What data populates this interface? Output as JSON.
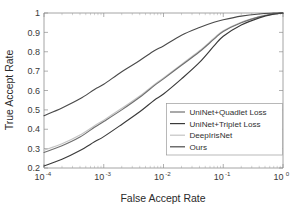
{
  "chart_data": {
    "type": "line",
    "title": "",
    "xlabel": "False Accept Rate",
    "ylabel": "True Accept Rate",
    "xscale": "log",
    "yscale": "linear",
    "xlim": [
      0.0001,
      1
    ],
    "ylim": [
      0.2,
      1
    ],
    "grid": false,
    "legend_position": "lower-right",
    "xticklabels": [
      "10-4",
      "10-3",
      "10-2",
      "10-1",
      "100"
    ],
    "xtick_bases": [
      "10",
      "10",
      "10",
      "10",
      "10"
    ],
    "xtick_exponents": [
      "-4",
      "-3",
      "-2",
      "-1",
      "0"
    ],
    "yticklabels": [
      "0.2",
      "0.3",
      "0.4",
      "0.5",
      "0.6",
      "0.7",
      "0.8",
      "0.9",
      "1"
    ],
    "ytickvalues": [
      0.2,
      0.3,
      0.4,
      0.5,
      0.6,
      0.7,
      0.8,
      0.9,
      1.0
    ],
    "x": [
      0.0001,
      0.0002,
      0.0004,
      0.0007,
      0.001,
      0.002,
      0.004,
      0.007,
      0.01,
      0.02,
      0.04,
      0.07,
      0.1,
      0.2,
      0.4,
      0.7,
      1.0
    ],
    "series": [
      {
        "name": "UniNet+Quadlet Loss",
        "color": "#6f6f6f",
        "values": [
          0.28,
          0.315,
          0.36,
          0.41,
          0.44,
          0.5,
          0.565,
          0.625,
          0.66,
          0.73,
          0.8,
          0.865,
          0.905,
          0.95,
          0.98,
          0.995,
          1.0
        ]
      },
      {
        "name": "UniNet+Triplet Loss",
        "color": "#3a3a3a",
        "values": [
          0.21,
          0.245,
          0.29,
          0.335,
          0.362,
          0.425,
          0.49,
          0.55,
          0.582,
          0.66,
          0.745,
          0.83,
          0.88,
          0.938,
          0.975,
          0.994,
          1.0
        ]
      },
      {
        "name": "DeepIrisNet",
        "color": "#c4c4c4",
        "values": [
          0.292,
          0.325,
          0.37,
          0.418,
          0.447,
          0.508,
          0.572,
          0.63,
          0.665,
          0.735,
          0.805,
          0.87,
          0.908,
          0.952,
          0.981,
          0.996,
          1.0
        ]
      },
      {
        "name": "Ours",
        "color": "#4a4a4a",
        "values": [
          0.47,
          0.51,
          0.557,
          0.605,
          0.632,
          0.697,
          0.755,
          0.805,
          0.83,
          0.885,
          0.925,
          0.952,
          0.965,
          0.984,
          0.995,
          0.999,
          1.0
        ]
      }
    ]
  },
  "legend": {
    "entries": [
      {
        "label": "UniNet+Quadlet Loss"
      },
      {
        "label": "UniNet+Triplet Loss"
      },
      {
        "label": "DeepIrisNet"
      },
      {
        "label": "Ours"
      }
    ]
  },
  "axes": {
    "x_title": "False Accept Rate",
    "y_title": "True Accept Rate"
  }
}
